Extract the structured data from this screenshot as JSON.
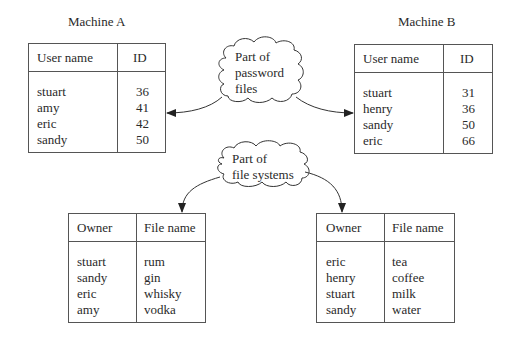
{
  "machine_a": {
    "title": "Machine A",
    "headers": [
      "User name",
      "ID"
    ],
    "users": [
      "stuart",
      "amy",
      "eric",
      "sandy"
    ],
    "ids": [
      "36",
      "41",
      "42",
      "50"
    ]
  },
  "machine_b": {
    "title": "Machine B",
    "headers": [
      "User name",
      "ID"
    ],
    "users": [
      "stuart",
      "henry",
      "sandy",
      "eric"
    ],
    "ids": [
      "31",
      "36",
      "50",
      "66"
    ]
  },
  "cloud_password": {
    "lines": [
      "Part of",
      "password",
      "files"
    ]
  },
  "cloud_filesystems": {
    "lines": [
      "Part of",
      "file systems"
    ]
  },
  "files_a": {
    "headers": [
      "Owner",
      "File name"
    ],
    "owners": [
      "stuart",
      "sandy",
      "eric",
      "amy"
    ],
    "files": [
      "rum",
      "gin",
      "whisky",
      "vodka"
    ]
  },
  "files_b": {
    "headers": [
      "Owner",
      "File name"
    ],
    "owners": [
      "eric",
      "henry",
      "stuart",
      "sandy"
    ],
    "files": [
      "tea",
      "coffee",
      "milk",
      "water"
    ]
  }
}
